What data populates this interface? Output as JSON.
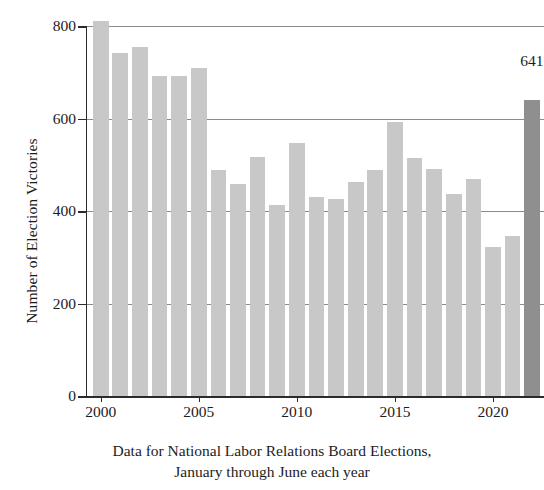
{
  "chart_data": {
    "type": "bar",
    "title": "",
    "xlabel": "",
    "ylabel": "Number of Election Victories",
    "categories": [
      "2000",
      "2001",
      "2002",
      "2003",
      "2004",
      "2005",
      "2006",
      "2007",
      "2008",
      "2009",
      "2010",
      "2011",
      "2012",
      "2013",
      "2014",
      "2015",
      "2016",
      "2017",
      "2018",
      "2019",
      "2020",
      "2021",
      "2022"
    ],
    "values": [
      810,
      741,
      755,
      692,
      692,
      710,
      488,
      458,
      516,
      412,
      548,
      430,
      426,
      462,
      489,
      592,
      515,
      490,
      437,
      470,
      322,
      347,
      641
    ],
    "ylim": [
      0,
      800
    ],
    "xlim_years": [
      1999.3,
      2022.6
    ],
    "ytick_labels": [
      "0",
      "200",
      "400",
      "600",
      "800"
    ],
    "ytick_values": [
      0,
      200,
      400,
      600,
      800
    ],
    "xtick_labels": [
      "2000",
      "2005",
      "2010",
      "2015",
      "2020"
    ],
    "xtick_values": [
      2000,
      2005,
      2010,
      2015,
      2020
    ],
    "grid": "horizontal",
    "legend": "none",
    "bar_color": "#c8c8c8",
    "highlight_color": "#8f8f8f",
    "highlight_category": "2022",
    "annotations": [
      {
        "text": "641",
        "category": "2022",
        "value": 641
      }
    ]
  },
  "caption": {
    "line1": "Data for National Labor Relations Board Elections,",
    "line2": "January through June each year"
  }
}
